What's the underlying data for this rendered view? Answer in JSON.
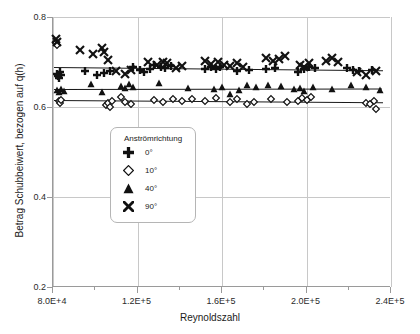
{
  "chart_data": {
    "type": "scatter",
    "title": "",
    "xlabel": "Reynoldszahl",
    "ylabel": "Betrag Schubbeiwert, bezogen auf q(h)",
    "xlim": [
      80000,
      240000
    ],
    "ylim": [
      0.2,
      0.8
    ],
    "grid": true,
    "legend_position": "center-left-inside",
    "x_ticks": [
      {
        "value": 80000,
        "label": "8.0E+4"
      },
      {
        "value": 120000,
        "label": "1.2E+5"
      },
      {
        "value": 160000,
        "label": "1.6E+5"
      },
      {
        "value": 200000,
        "label": "2.0E+5"
      },
      {
        "value": 240000,
        "label": "2.4E+5"
      }
    ],
    "x_minor_ticks": [
      100000,
      140000,
      180000,
      220000
    ],
    "y_ticks": [
      {
        "value": 0.8,
        "label": "0.8"
      },
      {
        "value": 0.6,
        "label": "0.6"
      },
      {
        "value": 0.4,
        "label": "0.4"
      },
      {
        "value": 0.2,
        "label": "0.2"
      }
    ],
    "legend_title": "Anströmrichtung",
    "series": [
      {
        "name": "0°",
        "marker": "plus",
        "filled": true,
        "points": [
          [
            82000,
            0.673
          ],
          [
            82500,
            0.669
          ],
          [
            83000,
            0.665
          ],
          [
            83500,
            0.677
          ],
          [
            84000,
            0.671
          ],
          [
            95000,
            0.681
          ],
          [
            101000,
            0.672
          ],
          [
            104000,
            0.676
          ],
          [
            107000,
            0.68
          ],
          [
            118000,
            0.689
          ],
          [
            121000,
            0.683
          ],
          [
            123000,
            0.678
          ],
          [
            126000,
            0.684
          ],
          [
            128000,
            0.694
          ],
          [
            131000,
            0.69
          ],
          [
            133000,
            0.686
          ],
          [
            136000,
            0.691
          ],
          [
            152000,
            0.685
          ],
          [
            155000,
            0.688
          ],
          [
            157000,
            0.684
          ],
          [
            159000,
            0.69
          ],
          [
            167000,
            0.681
          ],
          [
            173000,
            0.682
          ],
          [
            181000,
            0.684
          ],
          [
            185000,
            0.687
          ],
          [
            196000,
            0.677
          ],
          [
            199000,
            0.684
          ],
          [
            201000,
            0.688
          ],
          [
            204000,
            0.686
          ],
          [
            219000,
            0.686
          ],
          [
            222000,
            0.683
          ],
          [
            225000,
            0.681
          ],
          [
            231000,
            0.682
          ]
        ]
      },
      {
        "name": "10°",
        "marker": "diamond",
        "filled": false,
        "points": [
          [
            81500,
            0.742
          ],
          [
            82000,
            0.737
          ],
          [
            83000,
            0.613
          ],
          [
            83500,
            0.61
          ],
          [
            84000,
            0.616
          ],
          [
            105000,
            0.604
          ],
          [
            106000,
            0.609
          ],
          [
            107000,
            0.601
          ],
          [
            108000,
            0.614
          ],
          [
            112000,
            0.622
          ],
          [
            114000,
            0.611
          ],
          [
            117000,
            0.607
          ],
          [
            128000,
            0.616
          ],
          [
            132000,
            0.612
          ],
          [
            137000,
            0.618
          ],
          [
            141000,
            0.614
          ],
          [
            146000,
            0.617
          ],
          [
            152000,
            0.614
          ],
          [
            157000,
            0.621
          ],
          [
            164000,
            0.611
          ],
          [
            167000,
            0.618
          ],
          [
            172000,
            0.606
          ],
          [
            175000,
            0.611
          ],
          [
            183000,
            0.617
          ],
          [
            191000,
            0.612
          ],
          [
            196000,
            0.613
          ],
          [
            198000,
            0.619
          ],
          [
            200000,
            0.615
          ],
          [
            202000,
            0.622
          ],
          [
            228000,
            0.61
          ],
          [
            230000,
            0.606
          ],
          [
            232000,
            0.613
          ],
          [
            233000,
            0.595
          ]
        ]
      },
      {
        "name": "40°",
        "marker": "triangle",
        "filled": true,
        "points": [
          [
            82000,
            0.638
          ],
          [
            83000,
            0.633
          ],
          [
            84000,
            0.641
          ],
          [
            85000,
            0.636
          ],
          [
            98000,
            0.651
          ],
          [
            103000,
            0.633
          ],
          [
            112000,
            0.647
          ],
          [
            114000,
            0.643
          ],
          [
            116000,
            0.651
          ],
          [
            118000,
            0.645
          ],
          [
            130000,
            0.654
          ],
          [
            144000,
            0.643
          ],
          [
            156000,
            0.64
          ],
          [
            160000,
            0.645
          ],
          [
            164000,
            0.629
          ],
          [
            168000,
            0.637
          ],
          [
            172000,
            0.648
          ],
          [
            176000,
            0.644
          ],
          [
            182000,
            0.65
          ],
          [
            188000,
            0.647
          ],
          [
            194000,
            0.639
          ],
          [
            197000,
            0.643
          ],
          [
            199000,
            0.636
          ],
          [
            203000,
            0.644
          ],
          [
            212000,
            0.639
          ],
          [
            221000,
            0.648
          ],
          [
            228000,
            0.644
          ],
          [
            235000,
            0.637
          ]
        ]
      },
      {
        "name": "90°",
        "marker": "cross",
        "filled": true,
        "points": [
          [
            81500,
            0.752
          ],
          [
            82000,
            0.744
          ],
          [
            93000,
            0.727
          ],
          [
            99000,
            0.718
          ],
          [
            103000,
            0.731
          ],
          [
            104000,
            0.723
          ],
          [
            106000,
            0.704
          ],
          [
            110000,
            0.681
          ],
          [
            114000,
            0.673
          ],
          [
            117000,
            0.683
          ],
          [
            125000,
            0.699
          ],
          [
            129000,
            0.694
          ],
          [
            132000,
            0.701
          ],
          [
            134000,
            0.697
          ],
          [
            138000,
            0.686
          ],
          [
            141000,
            0.692
          ],
          [
            152000,
            0.703
          ],
          [
            155000,
            0.696
          ],
          [
            158000,
            0.701
          ],
          [
            161000,
            0.694
          ],
          [
            164000,
            0.691
          ],
          [
            167000,
            0.697
          ],
          [
            170000,
            0.688
          ],
          [
            181000,
            0.709
          ],
          [
            184000,
            0.702
          ],
          [
            187000,
            0.706
          ],
          [
            190000,
            0.713
          ],
          [
            197000,
            0.694
          ],
          [
            199000,
            0.69
          ],
          [
            201000,
            0.697
          ],
          [
            209000,
            0.703
          ],
          [
            212000,
            0.708
          ],
          [
            215000,
            0.7
          ],
          [
            224000,
            0.678
          ],
          [
            228000,
            0.672
          ],
          [
            233000,
            0.679
          ]
        ]
      }
    ],
    "trend_lines": [
      {
        "name": "trend-upper",
        "x0": 80500,
        "y0": 0.69,
        "x1": 236000,
        "y1": 0.683
      },
      {
        "name": "trend-middle",
        "x0": 80500,
        "y0": 0.639,
        "x1": 236000,
        "y1": 0.64
      },
      {
        "name": "trend-lower",
        "x0": 80500,
        "y0": 0.615,
        "x1": 236000,
        "y1": 0.61
      }
    ]
  },
  "legend": {
    "title": "Anströmrichtung",
    "items": [
      {
        "label": "0°",
        "marker": "plus"
      },
      {
        "label": "10°",
        "marker": "diamond"
      },
      {
        "label": "40°",
        "marker": "triangle"
      },
      {
        "label": "90°",
        "marker": "cross"
      }
    ]
  }
}
